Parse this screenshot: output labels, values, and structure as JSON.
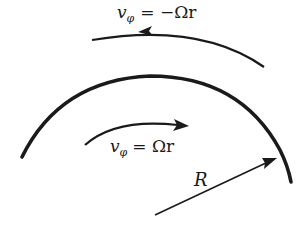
{
  "diagram": {
    "colors": {
      "stroke": "#1a1a1a",
      "background": "#ffffff"
    },
    "labels": {
      "outer_velocity": {
        "v": "v",
        "sub": "φ",
        "rhs": "= −Ωr"
      },
      "inner_velocity": {
        "v": "v",
        "sub": "φ",
        "rhs": "= Ωr"
      },
      "radius": "R"
    },
    "elements": {
      "boundary_arc": "thick arc of circle radius R",
      "outer_flow_arrow": "arc arrow pointing counter-clockwise (left)",
      "inner_flow_arrow": "arc arrow pointing clockwise (right)",
      "radius_arrow": "straight arrow from center toward boundary"
    }
  }
}
